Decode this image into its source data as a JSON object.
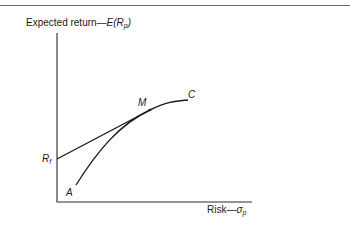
{
  "figure": {
    "y_axis_label_text": "Expected return—",
    "y_axis_label_math": "E(R",
    "y_axis_label_sub": "p",
    "y_axis_label_close": ")",
    "x_axis_label_text": "Risk—",
    "x_axis_label_math": "σ",
    "x_axis_label_sub": "p",
    "risk_free_label": "R",
    "risk_free_sub": "f",
    "point_labels": {
      "A": "A",
      "M": "M",
      "C": "C"
    }
  },
  "curves": [
    {
      "name": "capital market line",
      "from": "Rf",
      "to": "M",
      "type": "straight"
    },
    {
      "name": "efficient frontier",
      "from": "A",
      "through": "M",
      "to": "C",
      "type": "concave"
    }
  ]
}
